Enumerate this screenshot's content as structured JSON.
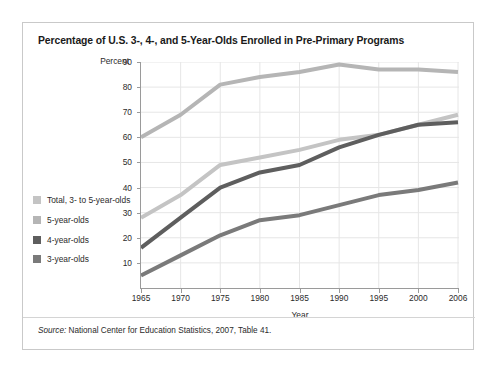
{
  "figure": {
    "title": "Percentage of U.S. 3-, 4-, and 5-Year-Olds Enrolled in Pre-Primary Programs",
    "source_prefix": "Source:",
    "source_text": " National Center for Education Statistics, 2007, Table 41."
  },
  "chart_data": {
    "type": "line",
    "title": "Percentage of U.S. 3-, 4-, and 5-Year-Olds Enrolled in Pre-Primary Programs",
    "xlabel": "Year",
    "ylabel": "Percent",
    "x": [
      1965,
      1970,
      1975,
      1980,
      1985,
      1990,
      1995,
      2000,
      2006
    ],
    "xtick_labels": [
      "1965",
      "1970",
      "1975",
      "1980",
      "1985",
      "1990",
      "1995",
      "2000",
      "2006"
    ],
    "ytick_labels": [
      "10",
      "20",
      "30",
      "40",
      "50",
      "60",
      "70",
      "80",
      "90"
    ],
    "yticks": [
      10,
      20,
      30,
      40,
      50,
      60,
      70,
      80,
      90
    ],
    "ylim": [
      0,
      90
    ],
    "xlim": [
      1965,
      2006
    ],
    "grid": true,
    "legend_position": "left-outside",
    "series": [
      {
        "name": "Total, 3- to 5-year-olds",
        "color": "#c4c4c4",
        "values": [
          28,
          37,
          49,
          52,
          55,
          59,
          61,
          65,
          69
        ]
      },
      {
        "name": "5-year-olds",
        "color": "#b5b5b5",
        "values": [
          60,
          69,
          81,
          84,
          86,
          89,
          87,
          87,
          86
        ]
      },
      {
        "name": "4-year-olds",
        "color": "#5e5e5e",
        "values": [
          16,
          28,
          40,
          46,
          49,
          56,
          61,
          65,
          66
        ]
      },
      {
        "name": "3-year-olds",
        "color": "#7a7a7a",
        "values": [
          5,
          13,
          21,
          27,
          29,
          33,
          37,
          39,
          42
        ]
      }
    ]
  },
  "legend": {
    "items": [
      {
        "label": "Total, 3- to 5-year-olds",
        "color": "#c4c4c4"
      },
      {
        "label": "5-year-olds",
        "color": "#b5b5b5"
      },
      {
        "label": "4-year-olds",
        "color": "#5e5e5e"
      },
      {
        "label": "3-year-olds",
        "color": "#7a7a7a"
      }
    ]
  }
}
